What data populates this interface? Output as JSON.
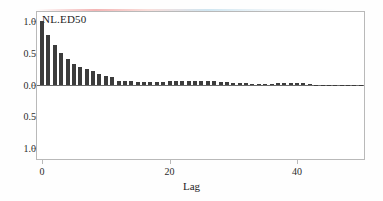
{
  "chart_data": {
    "type": "bar",
    "title": "NL.ED50",
    "xlabel": "Lag",
    "ylabel": "",
    "xlim": [
      -0.8,
      50.5
    ],
    "ylim": [
      -1.18,
      1.15
    ],
    "grid": false,
    "legend": null,
    "xticks": [
      0,
      20,
      40
    ],
    "xtick_labels": [
      "0",
      "20",
      "40"
    ],
    "yticks": [
      1.0,
      0.5,
      0.0,
      -0.5,
      -1.0
    ],
    "ytick_labels": [
      "1.0",
      "0.5",
      "0.0",
      "0.5",
      "1.0"
    ],
    "bar_color": "#3c3c3c",
    "baseline_color": "#6a6a6a",
    "frame_color": "#b9b9b9",
    "categories": [
      0,
      1,
      2,
      3,
      4,
      5,
      6,
      7,
      8,
      9,
      10,
      11,
      12,
      13,
      14,
      15,
      16,
      17,
      18,
      19,
      20,
      21,
      22,
      23,
      24,
      25,
      26,
      27,
      28,
      29,
      30,
      31,
      32,
      33,
      34,
      35,
      36,
      37,
      38,
      39,
      40,
      41,
      42,
      43,
      44,
      45,
      46,
      47,
      48,
      49,
      50
    ],
    "values": [
      1.0,
      0.79,
      0.63,
      0.5,
      0.4,
      0.33,
      0.28,
      0.24,
      0.22,
      0.16,
      0.14,
      0.12,
      0.06,
      0.05,
      0.05,
      0.04,
      0.04,
      0.04,
      0.04,
      0.04,
      0.05,
      0.05,
      0.05,
      0.06,
      0.06,
      0.06,
      0.06,
      0.05,
      0.04,
      0.04,
      0.03,
      0.02,
      0.02,
      0.01,
      0.01,
      0.01,
      0.01,
      0.02,
      0.03,
      0.03,
      0.03,
      0.02,
      0.01,
      0.0,
      -0.01,
      -0.02,
      -0.03,
      -0.03,
      -0.03,
      -0.03,
      -0.02
    ]
  }
}
